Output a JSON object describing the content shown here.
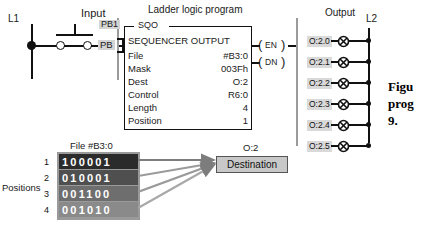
{
  "headings": {
    "input": "Input",
    "ladder_title": "Ladder logic program",
    "output": "Output",
    "l1": "L1",
    "l2": "L2",
    "positions": "Positions",
    "file_title": "File #B3:0",
    "dest_address": "O:2"
  },
  "input_rung": {
    "pb_label": "PB",
    "contact_label": "PB1"
  },
  "sqo": {
    "mnemonic": "SQO",
    "name": "SEQUENCER OUTPUT",
    "rows": [
      {
        "key": "File",
        "value": "#B3:0"
      },
      {
        "key": "Mask",
        "value": "003Fh"
      },
      {
        "key": "Dest",
        "value": "O:2"
      },
      {
        "key": "Control",
        "value": "R6:0"
      },
      {
        "key": "Length",
        "value": "4"
      },
      {
        "key": "Position",
        "value": "1"
      }
    ],
    "coils": [
      {
        "label": "EN"
      },
      {
        "label": "DN"
      }
    ]
  },
  "outputs": [
    {
      "address": "O:2.0"
    },
    {
      "address": "O:2.1"
    },
    {
      "address": "O:2.2"
    },
    {
      "address": "O:2.3"
    },
    {
      "address": "O:2.4"
    },
    {
      "address": "O:2.5"
    }
  ],
  "file_table": {
    "rows": [
      {
        "position": "1",
        "bits": "100001",
        "shade": "#2b2b2b"
      },
      {
        "position": "2",
        "bits": "010001",
        "shade": "#4f4f4f"
      },
      {
        "position": "3",
        "bits": "001100",
        "shade": "#6e6e6e"
      },
      {
        "position": "4",
        "bits": "001010",
        "shade": "#8a8a8a"
      }
    ]
  },
  "destination": {
    "label": "Destination"
  },
  "caption": {
    "line1": "Figu",
    "line2": "prog",
    "line3": "9."
  }
}
